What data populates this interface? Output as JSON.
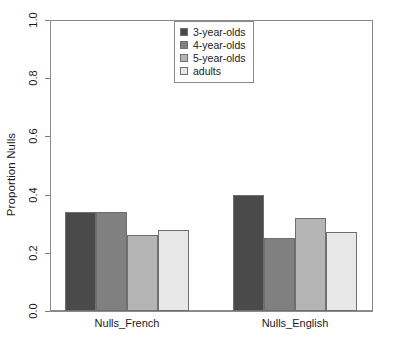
{
  "chart_data": {
    "type": "bar",
    "title": "",
    "subtitle": "",
    "xlabel": "",
    "ylabel": "Proportion Nulls",
    "categories": [
      "Nulls_French",
      "Nulls_English"
    ],
    "series": [
      {
        "name": "3-year-olds",
        "values": [
          0.34,
          0.4
        ],
        "color": "#4a4a4a"
      },
      {
        "name": "4-year-olds",
        "values": [
          0.34,
          0.25
        ],
        "color": "#808080"
      },
      {
        "name": "5-year-olds",
        "values": [
          0.26,
          0.32
        ],
        "color": "#b5b5b5"
      },
      {
        "name": "adults",
        "values": [
          0.28,
          0.27
        ],
        "color": "#e8e8e8"
      }
    ],
    "ylim": [
      0.0,
      1.0
    ],
    "ytick_values": [
      0.0,
      0.2,
      0.4,
      0.6,
      0.8,
      1.0
    ],
    "ytick_labels": [
      "0.0",
      "0.2",
      "0.4",
      "0.6",
      "0.8",
      "1.0"
    ],
    "grid": false,
    "legend_position": "top-center",
    "legend_entries": [
      "3-year-olds",
      "4-year-olds",
      "5-year-olds",
      "adults"
    ],
    "annotations": []
  },
  "axes": {
    "ylabel": "Proportion Nulls",
    "yticks": [
      {
        "label": "1.0",
        "value": 1.0
      },
      {
        "label": "0.8",
        "value": 0.8
      },
      {
        "label": "0.6",
        "value": 0.6
      },
      {
        "label": "0.4",
        "value": 0.4
      },
      {
        "label": "0.2",
        "value": 0.2
      },
      {
        "label": "0.0",
        "value": 0.0
      }
    ],
    "xticks": [
      {
        "label": "Nulls_French"
      },
      {
        "label": "Nulls_English"
      }
    ]
  },
  "legend": {
    "items": [
      {
        "label": "3-year-olds",
        "color": "#4a4a4a"
      },
      {
        "label": "4-year-olds",
        "color": "#808080"
      },
      {
        "label": "5-year-olds",
        "color": "#b5b5b5"
      },
      {
        "label": "adults",
        "color": "#e8e8e8"
      }
    ]
  },
  "colors": {
    "frame": "#8a8a8a",
    "axis": "#7d7d7d",
    "bar_outline": "#6f6f6f",
    "background": "#ffffff",
    "text": "#1a1a1a"
  }
}
